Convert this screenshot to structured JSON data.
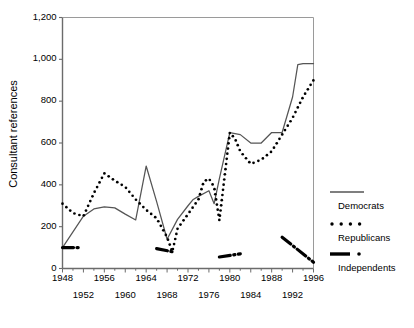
{
  "chart_data": {
    "type": "line",
    "title": "",
    "xlabel": "",
    "ylabel": "Consultant references",
    "xlim": [
      1948,
      1996
    ],
    "ylim": [
      0,
      1200
    ],
    "grid": false,
    "legend_position": "right",
    "y_ticks": [
      "0",
      "200",
      "400",
      "600",
      "800",
      "1,000",
      "1,200"
    ],
    "y_tick_values": [
      0,
      200,
      400,
      600,
      800,
      1000,
      1200
    ],
    "x_ticks_upper": [
      "1948",
      "1956",
      "1964",
      "1972",
      "1980",
      "1988",
      "1996"
    ],
    "x_ticks_lower": [
      "1952",
      "1960",
      "1968",
      "1976",
      "1984",
      "1992"
    ],
    "x_tick_values_upper": [
      1948,
      1956,
      1964,
      1972,
      1980,
      1988,
      1996
    ],
    "x_tick_values_lower": [
      1952,
      1960,
      1968,
      1976,
      1984,
      1992
    ],
    "series": [
      {
        "name": "Democrats",
        "style": "solid",
        "color": "#555555",
        "x": [
          1948,
          1950,
          1952,
          1954,
          1956,
          1958,
          1960,
          1962,
          1964,
          1966,
          1968,
          1970,
          1972,
          1973,
          1974,
          1976,
          1977,
          1978,
          1980,
          1982,
          1984,
          1986,
          1988,
          1990,
          1992,
          1993,
          1994,
          1996
        ],
        "values": [
          100,
          175,
          250,
          285,
          295,
          290,
          260,
          232,
          490,
          320,
          140,
          235,
          300,
          330,
          345,
          372,
          310,
          430,
          650,
          640,
          600,
          600,
          650,
          650,
          820,
          975,
          980,
          980
        ]
      },
      {
        "name": "Republicans",
        "style": "dotted",
        "color": "#000000",
        "x": [
          1948,
          1950,
          1952,
          1954,
          1956,
          1958,
          1960,
          1962,
          1964,
          1966,
          1968,
          1969,
          1970,
          1972,
          1974,
          1975,
          1976,
          1977,
          1978,
          1980,
          1981,
          1982,
          1984,
          1986,
          1988,
          1990,
          1992,
          1994,
          1996
        ],
        "values": [
          310,
          265,
          250,
          360,
          455,
          420,
          390,
          330,
          280,
          240,
          150,
          80,
          190,
          260,
          330,
          415,
          430,
          390,
          230,
          650,
          620,
          560,
          500,
          520,
          560,
          640,
          720,
          820,
          900
        ]
      },
      {
        "name": "Independents",
        "style": "dashdot",
        "color": "#000000",
        "segments": [
          {
            "x": [
              1948,
              1951
            ],
            "values": [
              100,
              100
            ]
          },
          {
            "x": [
              1966,
              1969
            ],
            "values": [
              95,
              80
            ]
          },
          {
            "x": [
              1978,
              1982
            ],
            "values": [
              55,
              70
            ]
          },
          {
            "x": [
              1990,
              1996
            ],
            "values": [
              150,
              30
            ]
          }
        ]
      }
    ]
  },
  "legend": {
    "items": [
      {
        "label": "Democrats",
        "style": "solid"
      },
      {
        "label": "Republicans",
        "style": "dotted"
      },
      {
        "label": "Independents",
        "style": "dashdot"
      }
    ]
  },
  "axis": {
    "y_title": "Consultant references"
  }
}
